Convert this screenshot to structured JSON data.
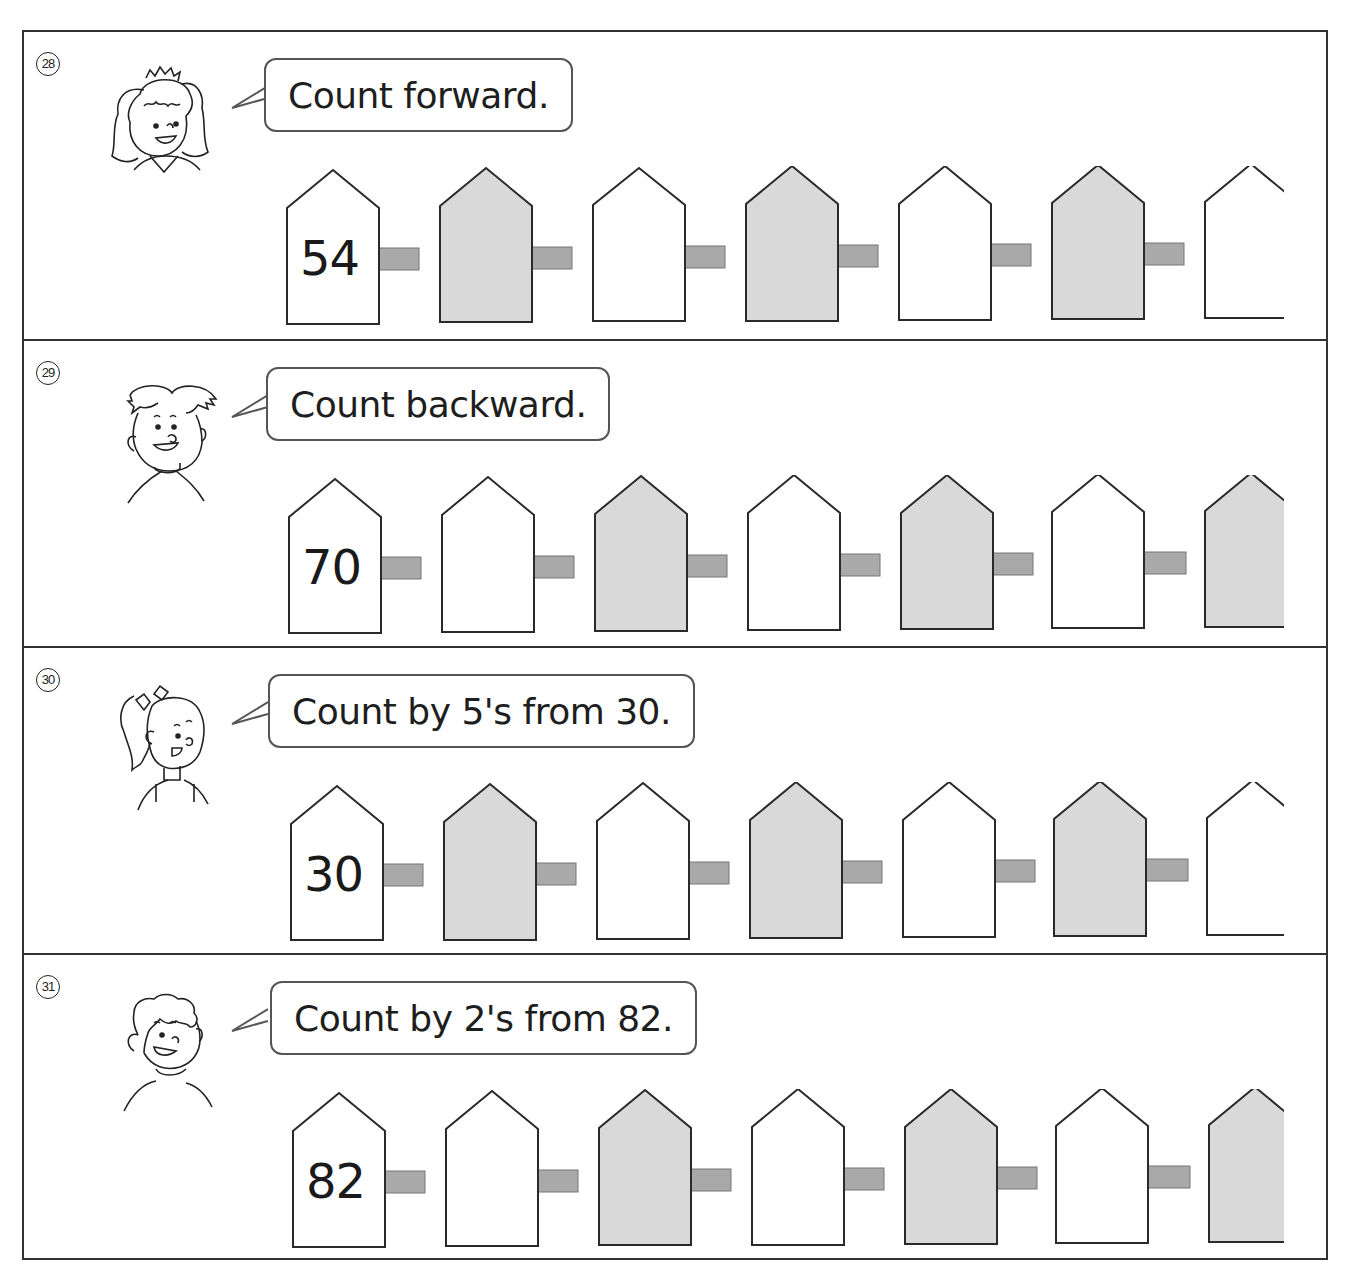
{
  "worksheet": {
    "problems": [
      {
        "number": "28",
        "number_glyph": "㉘",
        "character": "girl-with-pigtails",
        "instruction": "Count forward.",
        "start_value": "54",
        "posts": [
          "54",
          "",
          "",
          "",
          "",
          "",
          ""
        ],
        "shaded_posts": [
          1,
          3,
          5
        ]
      },
      {
        "number": "29",
        "number_glyph": "㉙",
        "character": "boy-spiky-hair",
        "instruction": "Count backward.",
        "start_value": "70",
        "posts": [
          "70",
          "",
          "",
          "",
          "",
          "",
          ""
        ],
        "shaded_posts": [
          2,
          4,
          6
        ]
      },
      {
        "number": "30",
        "number_glyph": "㉚",
        "character": "girl-with-ponytail",
        "instruction": "Count by 5's from 30.",
        "start_value": "30",
        "posts": [
          "30",
          "",
          "",
          "",
          "",
          "",
          ""
        ],
        "shaded_posts": [
          1,
          3,
          5
        ]
      },
      {
        "number": "31",
        "number_glyph": "㉛",
        "character": "boy-curly-hair",
        "instruction": "Count by 2's from 82.",
        "start_value": "82",
        "posts": [
          "82",
          "",
          "",
          "",
          "",
          "",
          ""
        ],
        "shaded_posts": [
          2,
          4,
          6
        ]
      }
    ],
    "colors": {
      "border": "#333333",
      "post_outline": "#2a2a2a",
      "post_shaded_fill": "#d9d9d9",
      "post_plain_fill": "#ffffff",
      "rail_fill": "#a9a9a9",
      "bubble_border": "#555555"
    }
  }
}
